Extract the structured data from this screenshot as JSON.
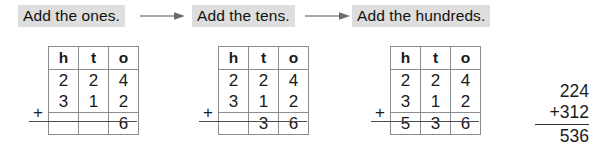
{
  "steps": {
    "arrow_icon": "arrow-right-icon",
    "items": [
      {
        "label": "Add the ones."
      },
      {
        "label": "Add the tens."
      },
      {
        "label": "Add the hundreds."
      }
    ]
  },
  "tables": {
    "headers": {
      "hundreds": "h",
      "tens": "t",
      "ones": "o"
    },
    "plus_sign": "+",
    "steps": [
      {
        "name": "ones-step",
        "addend_top": {
          "h": "2",
          "t": "2",
          "o": "4"
        },
        "addend_bottom": {
          "h": "3",
          "t": "1",
          "o": "2"
        },
        "sum": {
          "h": "",
          "t": "",
          "o": "6"
        }
      },
      {
        "name": "tens-step",
        "addend_top": {
          "h": "2",
          "t": "2",
          "o": "4"
        },
        "addend_bottom": {
          "h": "3",
          "t": "1",
          "o": "2"
        },
        "sum": {
          "h": "",
          "t": "3",
          "o": "6"
        }
      },
      {
        "name": "hundreds-step",
        "addend_top": {
          "h": "2",
          "t": "2",
          "o": "4"
        },
        "addend_bottom": {
          "h": "3",
          "t": "1",
          "o": "2"
        },
        "sum": {
          "h": "5",
          "t": "3",
          "o": "6"
        }
      }
    ]
  },
  "vertical_sum": {
    "addend_top": "224",
    "addend_bottom": "+312",
    "total": "536"
  },
  "colors": {
    "label_background": "#dedede",
    "text": "#1a1a1a",
    "grid_line": "#8c8c8c",
    "rule_line": "#4d4d4d",
    "page_background": "#ffffff"
  }
}
